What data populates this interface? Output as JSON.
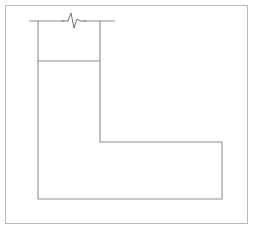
{
  "figure": {
    "canvas": {
      "width": 255,
      "height": 231,
      "background": "#ffffff"
    },
    "colors": {
      "frame_stroke": "#b9b9b9",
      "shape_stroke": "#8d8d8d",
      "break_stroke": "#6e6e6e",
      "background": "#ffffff"
    },
    "strokes": {
      "frame_width": 1,
      "shape_width": 1,
      "break_width": 1
    },
    "frame": {
      "name": "outer-border",
      "x": 5.5,
      "y": 5.5,
      "width": 242,
      "height": 218
    },
    "elements": [
      {
        "name": "l-shape-outline",
        "kind": "polyline",
        "points": "38,21 38,199 222,199 222,142 100,142 100,21"
      },
      {
        "name": "top-edge-line",
        "kind": "line",
        "x1": 29,
        "y1": 21,
        "x2": 115,
        "y2": 21
      },
      {
        "name": "inner-horizontal-line",
        "kind": "line",
        "x1": 38,
        "y1": 61,
        "x2": 100,
        "y2": 61
      },
      {
        "name": "break-symbol",
        "kind": "zigzag",
        "path": "M 62,21 L 68,21 L 71,13 L 74,28 L 77,19 L 80,21 L 86,21"
      }
    ]
  }
}
